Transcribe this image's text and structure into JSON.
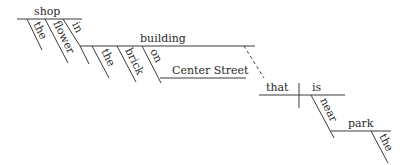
{
  "diagram": {
    "type": "reed-kellogg sentence diagram",
    "subject": {
      "word": "shop",
      "modifiers": [
        "the",
        "flower"
      ],
      "prepositional_phrase": {
        "preposition": "in",
        "object": {
          "word": "building",
          "modifiers": [
            "the",
            "brick"
          ],
          "prepositional_phrase": {
            "preposition": "on",
            "object": "Center Street"
          }
        }
      }
    },
    "relative_clause": {
      "subject": "that",
      "verb": "is",
      "prepositional_phrase": {
        "preposition": "near",
        "object": {
          "word": "park",
          "modifiers": [
            "the"
          ]
        }
      }
    }
  }
}
